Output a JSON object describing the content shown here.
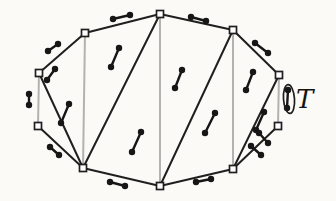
{
  "figure": {
    "label": {
      "text": "T",
      "x": 296,
      "y": 108,
      "font_size": 26
    },
    "colors": {
      "background": "#fbfaf7",
      "black_line": "#1f1f1f",
      "gray_line": "#b4b2ae",
      "dot": "#161616",
      "vertex_fill": "#ffffff"
    },
    "ellipse": {
      "cx": 289,
      "cy": 99,
      "rx": 5.5,
      "ry": 14.5,
      "tilt": -4
    },
    "vertex_square_size": 7,
    "dot_radius": 3.2,
    "vertices": {
      "top": [
        160,
        14
      ],
      "upper-left": [
        85,
        33
      ],
      "left-upper": [
        39,
        73
      ],
      "left-lower": [
        38,
        126
      ],
      "bottom-left": [
        83,
        168
      ],
      "bottom": [
        160,
        186
      ],
      "bottom-right": [
        233,
        169
      ],
      "right-lower": [
        278,
        126
      ],
      "right-upper": [
        279,
        75
      ],
      "upper-right": [
        233,
        30
      ]
    },
    "black_edges": [
      [
        "left-upper",
        "upper-left"
      ],
      [
        "upper-left",
        "top"
      ],
      [
        "top",
        "upper-right"
      ],
      [
        "upper-right",
        "right-upper"
      ],
      [
        "right-lower",
        "bottom-right"
      ],
      [
        "bottom-right",
        "bottom"
      ],
      [
        "bottom",
        "bottom-left"
      ],
      [
        "bottom-left",
        "left-lower"
      ],
      [
        "left-upper",
        "bottom-left"
      ],
      [
        "top",
        "bottom-left"
      ],
      [
        "upper-right",
        "bottom"
      ],
      [
        "right-upper",
        "bottom-right"
      ]
    ],
    "gray_edges": [
      [
        "left-lower",
        "left-upper"
      ],
      [
        "right-upper",
        "right-lower"
      ],
      [
        "upper-left",
        "bottom-left"
      ],
      [
        "top",
        "bottom"
      ],
      [
        "upper-right",
        "bottom-right"
      ]
    ],
    "dumbbells": [
      {
        "x1": 113,
        "y1": 19,
        "x2": 130,
        "y2": 15
      },
      {
        "x1": 191,
        "y1": 17,
        "x2": 206,
        "y2": 21
      },
      {
        "x1": 48,
        "y1": 51,
        "x2": 58,
        "y2": 44
      },
      {
        "x1": 29,
        "y1": 94,
        "x2": 29,
        "y2": 105
      },
      {
        "x1": 50,
        "y1": 147,
        "x2": 59,
        "y2": 155
      },
      {
        "x1": 110,
        "y1": 182,
        "x2": 125,
        "y2": 186
      },
      {
        "x1": 196,
        "y1": 182,
        "x2": 211,
        "y2": 179
      },
      {
        "x1": 251,
        "y1": 146,
        "x2": 261,
        "y2": 155
      },
      {
        "x1": 288,
        "y1": 90,
        "x2": 287,
        "y2": 108
      },
      {
        "x1": 255,
        "y1": 43,
        "x2": 268,
        "y2": 53
      },
      {
        "x1": 47,
        "y1": 80,
        "x2": 55,
        "y2": 69
      },
      {
        "x1": 61,
        "y1": 123,
        "x2": 69,
        "y2": 104
      },
      {
        "x1": 111,
        "y1": 67,
        "x2": 119,
        "y2": 48
      },
      {
        "x1": 132,
        "y1": 152,
        "x2": 141,
        "y2": 132
      },
      {
        "x1": 175,
        "y1": 88,
        "x2": 182,
        "y2": 70
      },
      {
        "x1": 205,
        "y1": 133,
        "x2": 215,
        "y2": 113
      },
      {
        "x1": 246,
        "y1": 90,
        "x2": 253,
        "y2": 72
      },
      {
        "x1": 256,
        "y1": 130,
        "x2": 264,
        "y2": 112
      },
      {
        "x1": 259,
        "y1": 133,
        "x2": 268,
        "y2": 143
      }
    ]
  }
}
